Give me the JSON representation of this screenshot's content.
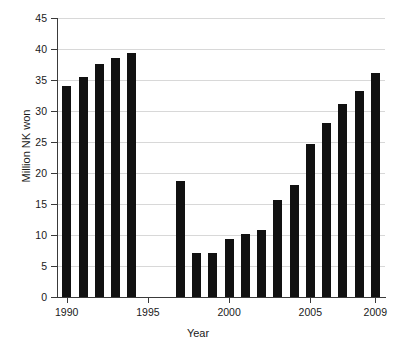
{
  "chart_data": {
    "type": "bar",
    "title": "",
    "xlabel": "Year",
    "ylabel": "Million NK won",
    "categories": [
      "1990",
      "1991",
      "1992",
      "1993",
      "1994",
      "1995",
      "1996",
      "1997",
      "1998",
      "1999",
      "2000",
      "2001",
      "2002",
      "2003",
      "2004",
      "2005",
      "2006",
      "2007",
      "2008",
      "2009"
    ],
    "values": [
      34.0,
      35.5,
      37.6,
      38.5,
      39.4,
      null,
      null,
      18.7,
      7.1,
      7.1,
      9.3,
      10.1,
      10.8,
      15.6,
      18.0,
      24.7,
      28.0,
      31.1,
      33.2,
      36.2
    ],
    "xlim": [
      1989.4,
      2009.6
    ],
    "ylim": [
      0,
      45
    ],
    "ytick_labels": [
      "0",
      "5",
      "10",
      "15",
      "20",
      "25",
      "30",
      "35",
      "40",
      "45"
    ],
    "ytick_values": [
      0,
      5,
      10,
      15,
      20,
      25,
      30,
      35,
      40,
      45
    ],
    "xtick_labels": [
      "1990",
      "1995",
      "2000",
      "2005",
      "2009"
    ],
    "xtick_values": [
      1990,
      1995,
      2000,
      2005,
      2009
    ],
    "grid": "horizontal",
    "legend": null,
    "bar_color": "#111111",
    "grid_color": "#d8d8d8",
    "axis_color": "#3a3a3a",
    "background": "#ffffff"
  }
}
